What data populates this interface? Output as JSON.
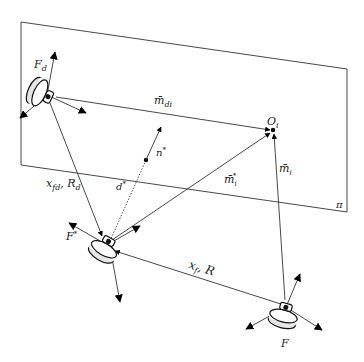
{
  "diagram": {
    "plane": {
      "label": "π",
      "corners": [
        [
          21,
          22
        ],
        [
          347,
          69
        ],
        [
          347,
          212
        ],
        [
          21,
          165
        ]
      ]
    },
    "frames": {
      "desired": {
        "label": "F",
        "sub": "d"
      },
      "reference": {
        "label": "F",
        "sup": "*"
      },
      "current": {
        "label": "F"
      }
    },
    "point": {
      "label": "O",
      "sub": "i"
    },
    "normal": {
      "label": "n",
      "sup": "*"
    },
    "distance": {
      "label": "d",
      "sup": "*"
    },
    "vectors": {
      "m_di": {
        "label": "m̄",
        "sub": "di"
      },
      "m_i_star": {
        "label": "m̄",
        "sub": "i",
        "sup": "*"
      },
      "m_i": {
        "label": "m̄",
        "sub": "i"
      }
    },
    "transforms": {
      "desired_to_reference": {
        "label": "x",
        "sub": "fd",
        "rest": ", R",
        "rest_sub": "d"
      },
      "current_to_reference": {
        "label": "x",
        "sub": "f",
        "rest": ", R"
      }
    }
  }
}
